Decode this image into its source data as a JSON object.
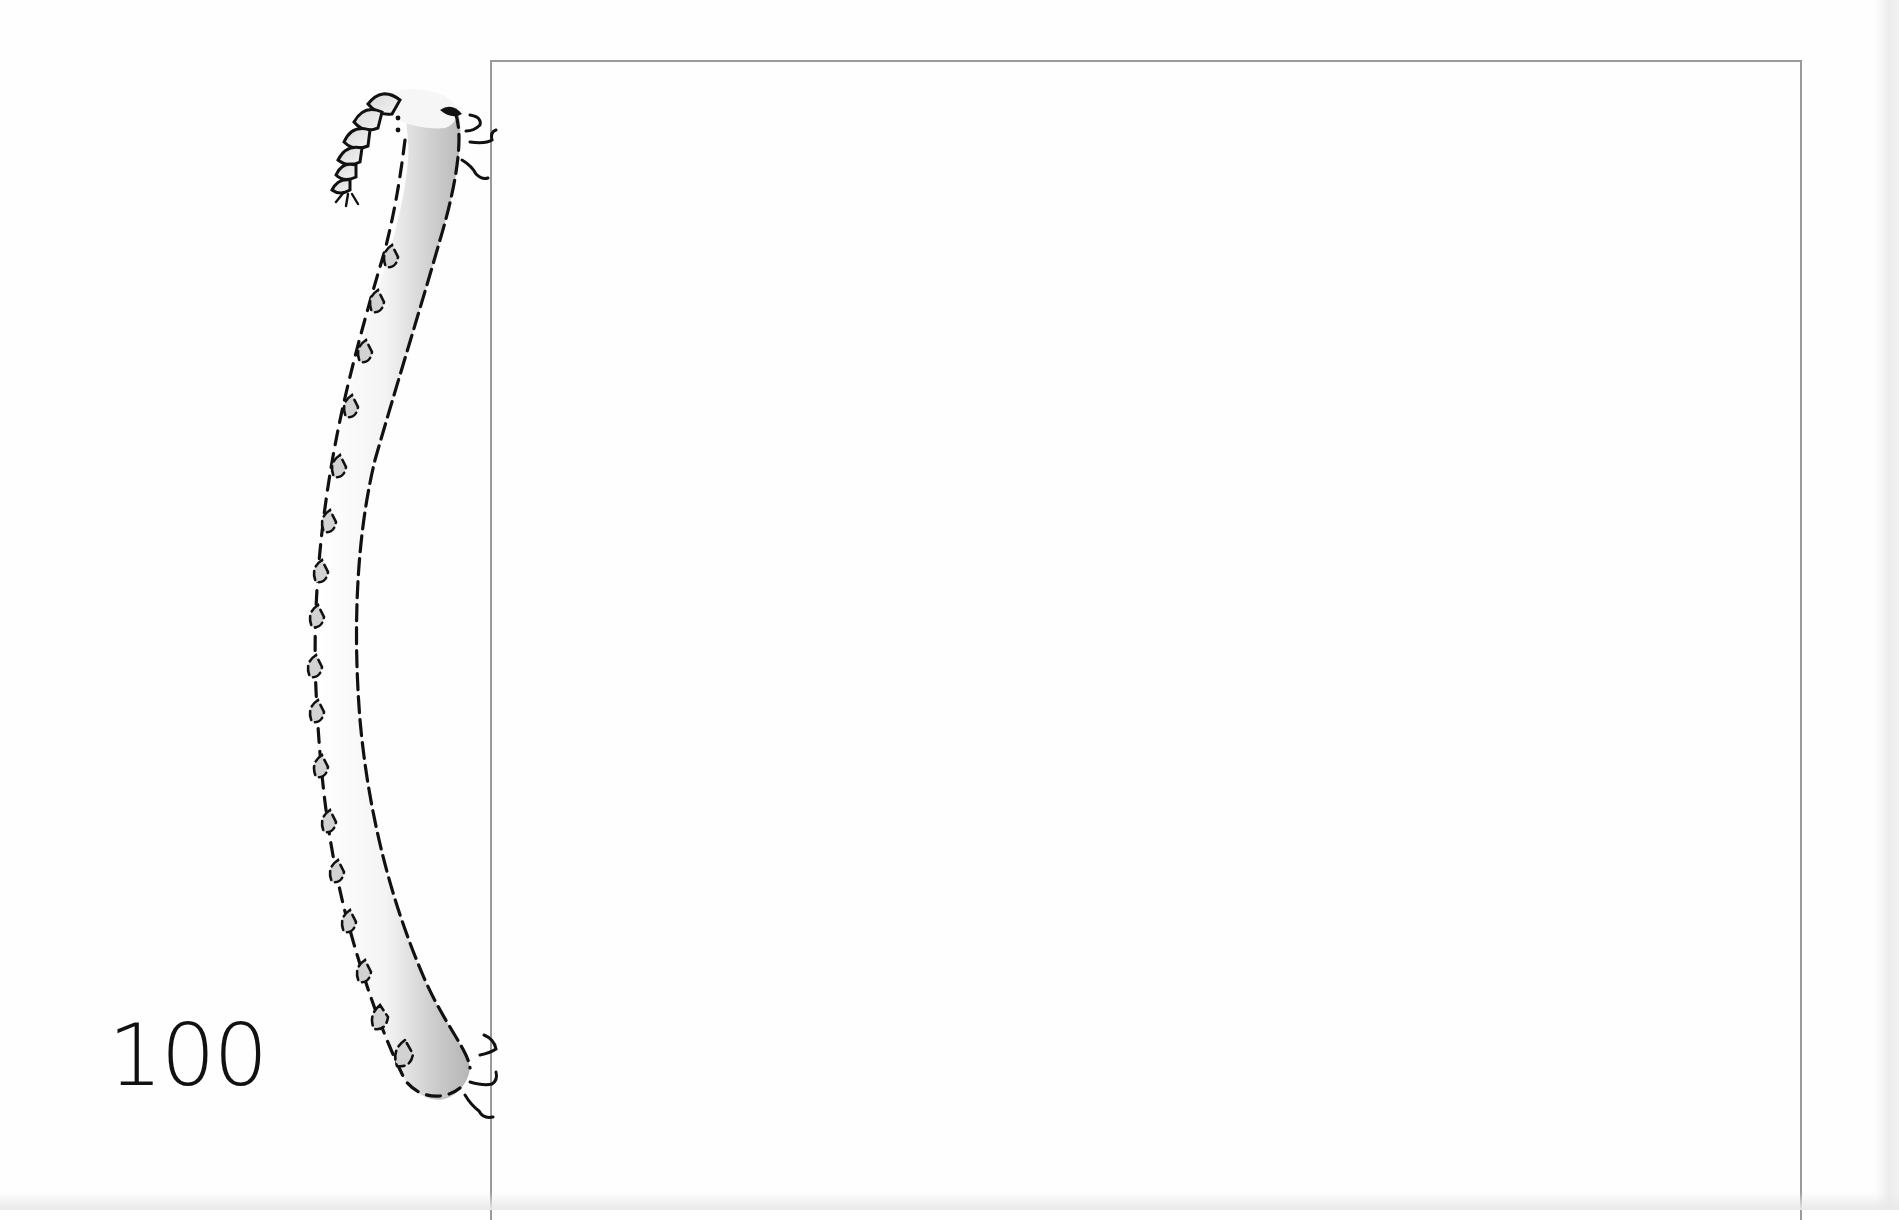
{
  "page": {
    "number_label": "100",
    "colors": {
      "background": "#fefefe",
      "frame_border": "#9a9a9a",
      "ink": "#111111",
      "worm_shade_dark": "#b8b8b8",
      "worm_shade_light": "#ffffff"
    }
  },
  "illustration": {
    "subject": "worm-drawing",
    "style": "dashed-outline-with-grey-shading"
  },
  "frame": {
    "description": "open-bottom rectangle drawing area"
  }
}
